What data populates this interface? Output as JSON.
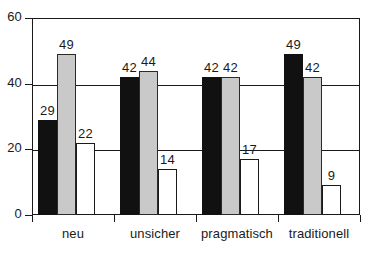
{
  "chart_data": {
    "type": "bar",
    "title": "",
    "subtitle": "",
    "xlabel": "",
    "ylabel": "",
    "categories": [
      "neu",
      "unsicher",
      "pragmatisch",
      "traditionell"
    ],
    "series": [
      {
        "name": "series-1-black",
        "color": "#111111",
        "values": [
          29,
          42,
          42,
          49
        ]
      },
      {
        "name": "series-2-gray",
        "color": "#c9c9c9",
        "values": [
          49,
          44,
          42,
          42
        ]
      },
      {
        "name": "series-3-white",
        "color": "#ffffff",
        "values": [
          22,
          14,
          17,
          9
        ]
      }
    ],
    "ylim": [
      0,
      60
    ],
    "yticks": [
      0,
      20,
      40,
      60
    ],
    "ytick_labels": [
      "0",
      "20",
      "40",
      "60"
    ],
    "grid": true,
    "legend": "none",
    "data_labels": [
      [
        "29",
        "49",
        "22"
      ],
      [
        "42",
        "44",
        "14"
      ],
      [
        "42",
        "42",
        "17"
      ],
      [
        "49",
        "42",
        "9"
      ]
    ]
  }
}
